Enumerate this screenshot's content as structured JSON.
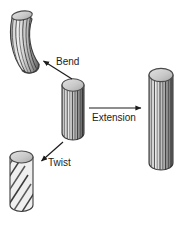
{
  "figure": {
    "title": ""
  },
  "labels": {
    "bend": "Bend",
    "twist": "Twist",
    "extension": "Extension"
  },
  "colors": {
    "background": "#ffffff",
    "outline": "#3a3a3a",
    "body_light": "#e8e8e8",
    "body_mid": "#b4b4b4",
    "body_dark": "#4a4a4a",
    "cap_fill": "#d0d0d0",
    "cap_edge": "#6b6b6b",
    "text": "#1c1c1c",
    "arrow": "#1c1c1c"
  },
  "objects": [
    {
      "name": "bent-cylinder",
      "mode": "bend",
      "position": "top-left",
      "striations": "curved-longitudinal",
      "bounds": {
        "x": 10,
        "y": 10,
        "w": 30,
        "h": 64
      }
    },
    {
      "name": "reference-cylinder",
      "mode": "undeformed",
      "position": "center",
      "striations": "vertical-longitudinal",
      "bounds": {
        "x": 62,
        "y": 78,
        "w": 22,
        "h": 62
      }
    },
    {
      "name": "twisted-cylinder",
      "mode": "twist",
      "position": "bottom-left",
      "striations": "helical-diagonal",
      "bounds": {
        "x": 10,
        "y": 150,
        "w": 23,
        "h": 62
      }
    },
    {
      "name": "extended-cylinder",
      "mode": "extension",
      "position": "right",
      "striations": "vertical-longitudinal",
      "bounds": {
        "x": 149,
        "y": 68,
        "w": 24,
        "h": 102
      }
    }
  ],
  "arrows": [
    {
      "name": "bend-arrow",
      "label": "Bend",
      "from": [
        72,
        79
      ],
      "to": [
        42,
        60
      ],
      "direction": "up-left"
    },
    {
      "name": "twist-arrow",
      "label": "Twist",
      "from": [
        63,
        142
      ],
      "to": [
        40,
        162
      ],
      "direction": "down-left"
    },
    {
      "name": "extension-arrow",
      "label": "Extension",
      "from": [
        89,
        108
      ],
      "to": [
        142,
        108
      ],
      "direction": "right"
    }
  ]
}
